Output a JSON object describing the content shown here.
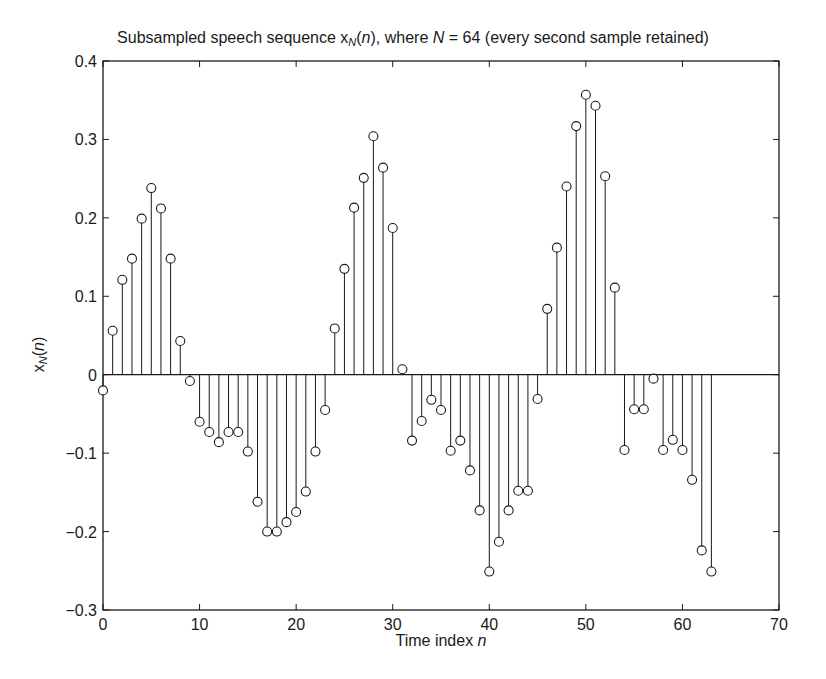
{
  "chart_data": {
    "type": "stem",
    "title_parts": {
      "prefix": "Subsampled speech sequence x",
      "sub": "N",
      "paren_open": "(",
      "var": "n",
      "mid": "), where ",
      "N": "N",
      "suffix": " = 64 (every second sample retained)"
    },
    "xlabel": "Time index n",
    "xlabel_parts": {
      "text": "Time index ",
      "var": "n"
    },
    "ylabel": "x_N(n)",
    "ylabel_parts": {
      "x": "x",
      "sub": "N",
      "open": "(",
      "var": "n",
      "close": ")"
    },
    "xlim": [
      0,
      70
    ],
    "ylim": [
      -0.3,
      0.4
    ],
    "xticks": [
      0,
      10,
      20,
      30,
      40,
      50,
      60,
      70
    ],
    "yticks": [
      -0.3,
      -0.2,
      -0.1,
      0,
      0.1,
      0.2,
      0.3,
      0.4
    ],
    "ytick_labels": [
      "-0.3",
      "-0.2",
      "-0.1",
      "0",
      "0.1",
      "0.2",
      "0.3",
      "0.4"
    ],
    "grid": false,
    "legend": null,
    "marker": "circle",
    "x": [
      0,
      1,
      2,
      3,
      4,
      5,
      6,
      7,
      8,
      9,
      10,
      11,
      12,
      13,
      14,
      15,
      16,
      17,
      18,
      19,
      20,
      21,
      22,
      23,
      24,
      25,
      26,
      27,
      28,
      29,
      30,
      31,
      32,
      33,
      34,
      35,
      36,
      37,
      38,
      39,
      40,
      41,
      42,
      43,
      44,
      45,
      46,
      47,
      48,
      49,
      50,
      51,
      52,
      53,
      54,
      55,
      56,
      57,
      58,
      59,
      60,
      61,
      62,
      63
    ],
    "values": [
      -0.02,
      0.056,
      0.121,
      0.148,
      0.199,
      0.238,
      0.212,
      0.148,
      0.043,
      -0.008,
      -0.06,
      -0.073,
      -0.086,
      -0.073,
      -0.073,
      -0.098,
      -0.162,
      -0.2,
      -0.2,
      -0.188,
      -0.175,
      -0.149,
      -0.098,
      -0.045,
      0.059,
      0.135,
      0.213,
      0.251,
      0.304,
      0.264,
      0.187,
      0.007,
      -0.084,
      -0.059,
      -0.032,
      -0.045,
      -0.097,
      -0.084,
      -0.122,
      -0.173,
      -0.251,
      -0.213,
      -0.173,
      -0.148,
      -0.148,
      -0.031,
      0.084,
      0.162,
      0.24,
      0.317,
      0.357,
      0.343,
      0.253,
      0.111,
      -0.096,
      -0.044,
      -0.044,
      -0.005,
      -0.096,
      -0.083,
      -0.096,
      -0.134,
      -0.224,
      -0.251
    ]
  },
  "style": {
    "line_color": "#1a1a1a",
    "background": "#ffffff"
  }
}
